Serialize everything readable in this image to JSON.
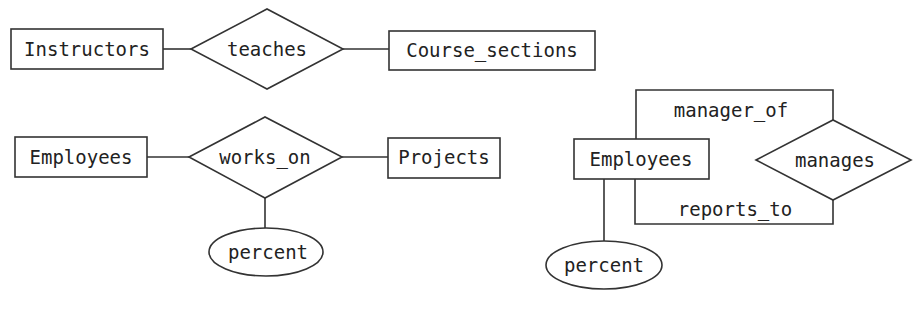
{
  "diagrams": [
    {
      "entities": [
        {
          "label": "Instructors"
        },
        {
          "label": "Course_sections"
        }
      ],
      "relationship": {
        "label": "teaches"
      }
    },
    {
      "entities": [
        {
          "label": "Employees"
        },
        {
          "label": "Projects"
        }
      ],
      "relationship": {
        "label": "works_on"
      },
      "attribute": {
        "label": "percent"
      }
    },
    {
      "entities": [
        {
          "label": "Employees"
        }
      ],
      "relationship": {
        "label": "manages"
      },
      "roles": [
        {
          "label": "manager_of"
        },
        {
          "label": "reports_to"
        }
      ],
      "attribute": {
        "label": "percent"
      }
    }
  ]
}
